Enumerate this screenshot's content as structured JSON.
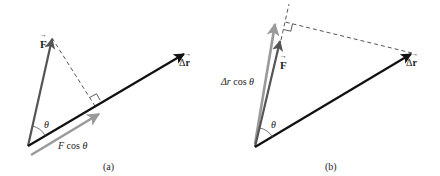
{
  "panels": [
    {
      "id": "a",
      "caption": "(a)",
      "labels": {
        "force": "F",
        "displacement_delta": "Δ",
        "displacement": "r",
        "angle": "θ",
        "projection_prefix": "F",
        "projection_cos": "cos",
        "projection_theta": "θ"
      }
    },
    {
      "id": "b",
      "caption": "(b)",
      "labels": {
        "force": "F",
        "displacement_delta": "Δ",
        "displacement": "r",
        "angle": "θ",
        "projection_prefix": "Δr",
        "projection_cos": "cos",
        "projection_theta": "θ"
      }
    }
  ],
  "colors": {
    "displacement_vector": "#111111",
    "force_vector": "#555555",
    "projection_vector": "#9a9a9a",
    "dashed_line": "#444444"
  }
}
